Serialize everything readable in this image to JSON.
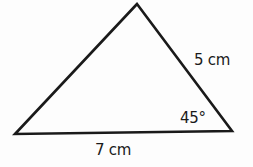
{
  "diagram": {
    "type": "triangle",
    "vertices": {
      "apex": [
        137,
        4
      ],
      "bottom_left": [
        15,
        134
      ],
      "bottom_right": [
        232,
        131
      ]
    },
    "stroke_color": "#1a1a1a",
    "background_color": "#fdfdfd",
    "labels": {
      "right_side": "5 cm",
      "angle_bottom_right": "45°",
      "base": "7 cm"
    }
  }
}
